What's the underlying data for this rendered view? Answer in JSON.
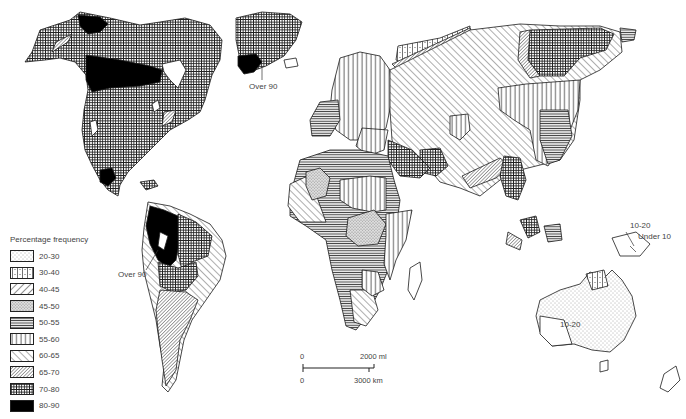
{
  "figure": {
    "type": "choropleth-map"
  },
  "legend": {
    "title": "Percentage frequency",
    "items": [
      {
        "label": "20-30",
        "pattern": "fine-dots"
      },
      {
        "label": "30-40",
        "pattern": "grid-dotted"
      },
      {
        "label": "40-45",
        "pattern": "diagonal-forward-wide"
      },
      {
        "label": "45-50",
        "pattern": "dense-stipple"
      },
      {
        "label": "50-55",
        "pattern": "horizontal-lines"
      },
      {
        "label": "55-60",
        "pattern": "vertical-lines"
      },
      {
        "label": "60-65",
        "pattern": "diagonal-back-wide"
      },
      {
        "label": "65-70",
        "pattern": "diagonal-forward-dense"
      },
      {
        "label": "70-80",
        "pattern": "crosshatch-dense"
      },
      {
        "label": "80-90",
        "pattern": "solid-black"
      }
    ]
  },
  "annotations": {
    "greenland": "Over 90",
    "south_america": "Over 90",
    "new_guinea_upper": "10-20",
    "new_guinea_lower": "Under 10",
    "australia": "10-20"
  },
  "scale_bar": {
    "top_start": "0",
    "top_end": "2000 ml",
    "bottom_start": "0",
    "bottom_end": "3000 km"
  },
  "colors": {
    "ink": "#1a1a1a",
    "background": "#ffffff",
    "text": "#444444"
  }
}
